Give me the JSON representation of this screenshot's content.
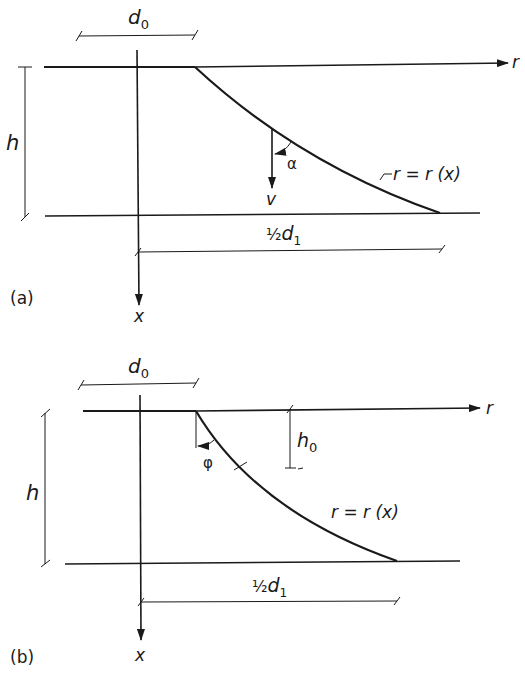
{
  "figure": {
    "panel_a": {
      "label": "(a)",
      "dimension_top": "d",
      "dimension_top_sub": "0",
      "height_label": "h",
      "axis_r": "r",
      "axis_x": "x",
      "velocity_label": "v",
      "angle_label": "α",
      "curve_label": "r = r (x)",
      "dimension_bottom_frac": "½",
      "dimension_bottom": "d",
      "dimension_bottom_sub": "1"
    },
    "panel_b": {
      "label": "(b)",
      "dimension_top": "d",
      "dimension_top_sub": "0",
      "height_label": "h",
      "axis_r": "r",
      "axis_x": "x",
      "angle_label": "φ",
      "offset_label": "h",
      "offset_label_sub": "0",
      "curve_label": "r = r (x)",
      "dimension_bottom_frac": "½",
      "dimension_bottom": "d",
      "dimension_bottom_sub": "1"
    }
  }
}
